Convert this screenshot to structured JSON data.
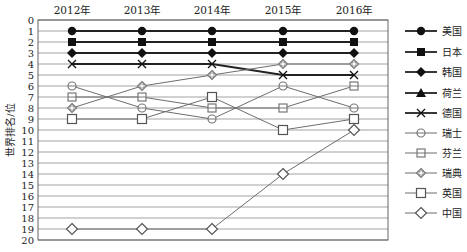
{
  "chart_data": {
    "type": "line",
    "title": "",
    "xlabel": "",
    "ylabel": "世界排名/位",
    "x_axis_position": "top",
    "categories": [
      "2012年",
      "2013年",
      "2014年",
      "2015年",
      "2016年"
    ],
    "y_ticks": [
      0,
      1,
      2,
      3,
      4,
      5,
      6,
      7,
      8,
      9,
      10,
      11,
      12,
      13,
      14,
      15,
      16,
      17,
      18,
      19,
      20
    ],
    "ylim": [
      0,
      20
    ],
    "y_inverted": true,
    "grid": true,
    "legend_position": "right",
    "series": [
      {
        "name": "美国",
        "marker": "circle-filled",
        "values": [
          1,
          1,
          1,
          1,
          1
        ]
      },
      {
        "name": "日本",
        "marker": "square-filled",
        "values": [
          2,
          2,
          2,
          2,
          2
        ]
      },
      {
        "name": "韩国",
        "marker": "diamond-filled",
        "values": [
          3,
          3,
          3,
          3,
          3
        ]
      },
      {
        "name": "荷兰",
        "marker": "triangle-filled",
        "values": [
          null,
          null,
          null,
          null,
          null
        ]
      },
      {
        "name": "德国",
        "marker": "cross",
        "values": [
          4,
          4,
          4,
          5,
          5
        ]
      },
      {
        "name": "瑞士",
        "marker": "circle-open",
        "values": [
          6,
          8,
          9,
          6,
          8
        ]
      },
      {
        "name": "芬兰",
        "marker": "square-open-line",
        "values": [
          7,
          7,
          8,
          8,
          6
        ]
      },
      {
        "name": "瑞典",
        "marker": "diamond-open-small",
        "values": [
          8,
          6,
          5,
          4,
          4
        ]
      },
      {
        "name": "英国",
        "marker": "square-open",
        "values": [
          9,
          9,
          7,
          10,
          9
        ]
      },
      {
        "name": "中国",
        "marker": "diamond-open",
        "values": [
          19,
          19,
          19,
          14,
          10
        ]
      }
    ]
  }
}
